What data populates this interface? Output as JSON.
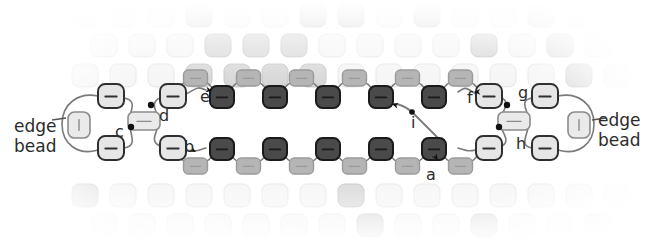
{
  "diagram": {
    "type": "bead-weaving-stitch-diagram",
    "background_color": "#ffffff",
    "thread_color": "#7b7b7b",
    "text_color": "#2b2b2b"
  },
  "labels": {
    "edge_bead_left": "edge\nbead",
    "edge_bead_right": "edge\nbead",
    "a": "a",
    "b": "b",
    "c": "c",
    "d": "d",
    "e": "e",
    "f": "f",
    "g": "g",
    "h": "h",
    "i": "i"
  },
  "label_positions": [
    {
      "key": "edge_bead_left",
      "text": "edge\nbead",
      "x": 14,
      "y": 116,
      "kind": "edge"
    },
    {
      "key": "edge_bead_right",
      "text": "edge\nbead",
      "x": 598,
      "y": 110,
      "kind": "edge"
    },
    {
      "key": "e",
      "text": "e",
      "x": 200,
      "y": 89,
      "kind": "letter"
    },
    {
      "key": "f",
      "text": "f",
      "x": 467,
      "y": 90,
      "kind": "letter"
    },
    {
      "key": "g",
      "text": "g",
      "x": 518,
      "y": 85,
      "kind": "letter"
    },
    {
      "key": "h",
      "text": "h",
      "x": 516,
      "y": 136,
      "kind": "letter"
    },
    {
      "key": "c",
      "text": "c",
      "x": 115,
      "y": 124,
      "kind": "letter"
    },
    {
      "key": "d",
      "text": "d",
      "x": 159,
      "y": 108,
      "kind": "letter"
    },
    {
      "key": "b",
      "text": "b",
      "x": 184,
      "y": 139,
      "kind": "letter"
    },
    {
      "key": "a",
      "text": "a",
      "x": 426,
      "y": 167,
      "kind": "letter"
    },
    {
      "key": "i",
      "text": "i",
      "x": 411,
      "y": 115,
      "kind": "letter"
    }
  ],
  "bead_colors": {
    "dark": "#4a4a4a",
    "dark_stroke": "#1a1a1a",
    "mid": "#b5b5b5",
    "mid_stroke": "#9a9a9a",
    "light": "#e6e6e6",
    "light_stroke": "#2f2f2f",
    "edge_light": "#eaeaea",
    "edge_stroke": "#8c8c8c",
    "bg_faint": "#f2f2f2",
    "bg_mid": "#c9c9c9"
  },
  "rows": {
    "top_chain_dark_beads": 5,
    "top_chain_mid_beads": 6,
    "bottom_chain_dark_beads": 5,
    "bottom_chain_mid_beads": 6,
    "edge_beads_left": 1,
    "edge_beads_right": 1
  },
  "background_grid": {
    "columns": 14,
    "rows": 6,
    "cell_width": 38,
    "cell_height": 30,
    "bead_size": 26,
    "offset_stagger": 19,
    "note": "faded rounded-square beads, brick-offset rows, fading toward image edges"
  },
  "annotations": {
    "arrowheads": [
      "b",
      "e",
      "f",
      "a",
      "c",
      "d",
      "g",
      "h",
      "i"
    ],
    "leader_lines": [
      "edge_bead_left",
      "edge_bead_right"
    ]
  }
}
